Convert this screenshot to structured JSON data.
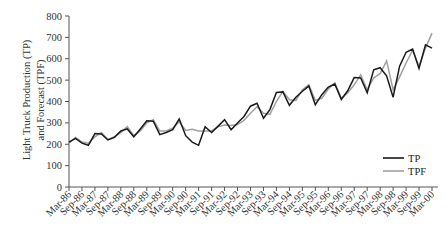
{
  "chart_data": {
    "type": "line",
    "title": "",
    "xlabel": "",
    "ylabel": "Light Truck Production (TP) and Forecast (TPF)",
    "ylabel_lines": [
      "Light Truck Production (TP)",
      "and Forecast (TPF)"
    ],
    "ylim": [
      0,
      800
    ],
    "yticks": [
      0,
      100,
      200,
      300,
      400,
      500,
      600,
      700,
      800
    ],
    "grid": false,
    "legend_position": "lower-right",
    "x_tick_labels": [
      "Mar-86",
      "Sep-86",
      "Mar-87",
      "Sep-87",
      "Mar-88",
      "Sep-88",
      "Mar-89",
      "Sep-89",
      "Mar-90",
      "Sep-90",
      "Mar-91",
      "Sep-91",
      "Mar-92",
      "Sep-92",
      "Mar-93",
      "Sep-93",
      "Mar-94",
      "Sep-94",
      "Mar-95",
      "Sep-95",
      "Mar-96",
      "Sep-96",
      "Mar-97",
      "Sep-97",
      "Mar-98",
      "Sep-98",
      "Mar-99",
      "Sep-99",
      "Mar-00"
    ],
    "x_frequency": "quarterly",
    "series": [
      {
        "name": "TP",
        "color": "#1a1a1a",
        "values": [
          210,
          228,
          205,
          195,
          250,
          248,
          220,
          232,
          262,
          272,
          235,
          272,
          310,
          308,
          245,
          255,
          268,
          318,
          240,
          210,
          195,
          282,
          255,
          285,
          315,
          268,
          300,
          330,
          378,
          392,
          322,
          362,
          442,
          445,
          382,
          420,
          448,
          472,
          385,
          432,
          468,
          482,
          410,
          450,
          512,
          510,
          440,
          548,
          558,
          520,
          420,
          565,
          630,
          645,
          555,
          665,
          650
        ]
      },
      {
        "name": "TPF",
        "color": "#a0a0a0",
        "values": [
          205,
          232,
          210,
          205,
          235,
          255,
          222,
          235,
          255,
          282,
          240,
          262,
          300,
          315,
          262,
          262,
          275,
          305,
          265,
          270,
          262,
          262,
          262,
          282,
          290,
          288,
          292,
          312,
          345,
          375,
          345,
          340,
          400,
          448,
          408,
          405,
          455,
          478,
          405,
          415,
          458,
          488,
          415,
          440,
          478,
          525,
          455,
          510,
          530,
          590,
          455,
          515,
          580,
          640,
          565,
          650,
          720
        ]
      }
    ]
  },
  "legend": {
    "items": [
      {
        "label": "TP",
        "color": "#1a1a1a"
      },
      {
        "label": "TPF",
        "color": "#a0a0a0"
      }
    ]
  }
}
